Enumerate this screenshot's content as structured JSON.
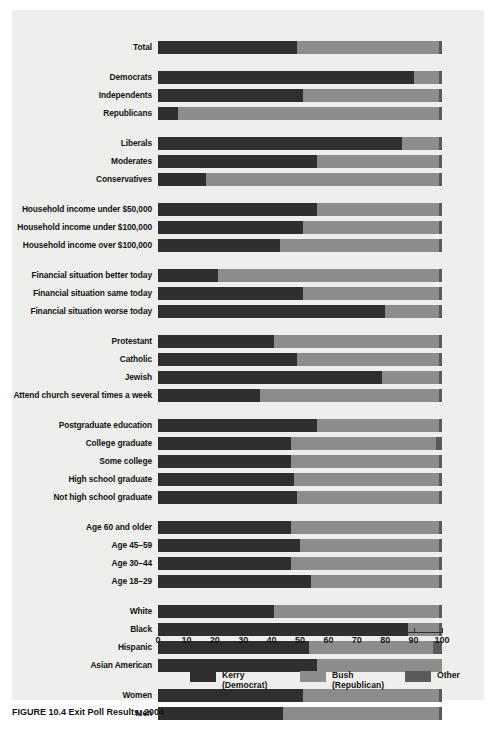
{
  "figure": {
    "caption": "FIGURE 10.4   Exit Poll Results, 2004"
  },
  "chart_data": {
    "type": "bar",
    "orientation": "horizontal",
    "stacked": true,
    "title": "",
    "xlabel": "",
    "ylabel": "",
    "xlim": [
      0,
      100
    ],
    "xticks": [
      0,
      10,
      20,
      30,
      40,
      50,
      60,
      70,
      80,
      90,
      100
    ],
    "grid": false,
    "legend_position": "bottom",
    "series": [
      {
        "name": "Kerry",
        "sub": "(Democrat)",
        "color": "#2f2f2f"
      },
      {
        "name": "Bush",
        "sub": "(Republican)",
        "color": "#8c8c8c"
      },
      {
        "name": "Other",
        "sub": "",
        "color": "#5a5a5a"
      }
    ],
    "groups": [
      {
        "name": "total",
        "rows": [
          {
            "label": "Total",
            "values": [
              49,
              50,
              1
            ]
          }
        ]
      },
      {
        "name": "party",
        "rows": [
          {
            "label": "Democrats",
            "values": [
              90,
              9,
              1
            ]
          },
          {
            "label": "Independents",
            "values": [
              51,
              48,
              1
            ]
          },
          {
            "label": "Republicans",
            "values": [
              7,
              92,
              1
            ]
          }
        ]
      },
      {
        "name": "ideology",
        "rows": [
          {
            "label": "Liberals",
            "values": [
              86,
              13,
              1
            ]
          },
          {
            "label": "Moderates",
            "values": [
              56,
              43,
              1
            ]
          },
          {
            "label": "Conservatives",
            "values": [
              17,
              82,
              1
            ]
          }
        ]
      },
      {
        "name": "income",
        "rows": [
          {
            "label": "Household income under $50,000",
            "values": [
              56,
              43,
              1
            ]
          },
          {
            "label": "Household income under $100,000",
            "values": [
              51,
              48,
              1
            ]
          },
          {
            "label": "Household income over $100,000",
            "values": [
              43,
              56,
              1
            ]
          }
        ]
      },
      {
        "name": "financial-situation",
        "rows": [
          {
            "label": "Financial situation better today",
            "values": [
              21,
              78,
              1
            ]
          },
          {
            "label": "Financial situation same today",
            "values": [
              51,
              48,
              1
            ]
          },
          {
            "label": "Financial situation worse today",
            "values": [
              80,
              19,
              1
            ]
          }
        ]
      },
      {
        "name": "religion",
        "rows": [
          {
            "label": "Protestant",
            "values": [
              41,
              58,
              1
            ]
          },
          {
            "label": "Catholic",
            "values": [
              49,
              50,
              1
            ]
          },
          {
            "label": "Jewish",
            "values": [
              79,
              20,
              1
            ]
          },
          {
            "label": "Attend church several times a week",
            "values": [
              36,
              63,
              1
            ]
          }
        ]
      },
      {
        "name": "education",
        "rows": [
          {
            "label": "Postgraduate education",
            "values": [
              56,
              43,
              1
            ]
          },
          {
            "label": "College graduate",
            "values": [
              47,
              51,
              2
            ]
          },
          {
            "label": "Some college",
            "values": [
              47,
              52,
              1
            ]
          },
          {
            "label": "High school graduate",
            "values": [
              48,
              51,
              1
            ]
          },
          {
            "label": "Not high school graduate",
            "values": [
              49,
              50,
              1
            ]
          }
        ]
      },
      {
        "name": "age",
        "rows": [
          {
            "label": "Age 60 and older",
            "values": [
              47,
              52,
              1
            ]
          },
          {
            "label": "Age 45–59",
            "values": [
              50,
              49,
              1
            ]
          },
          {
            "label": "Age 30–44",
            "values": [
              47,
              52,
              1
            ]
          },
          {
            "label": "Age 18–29",
            "values": [
              54,
              45,
              1
            ]
          }
        ]
      },
      {
        "name": "race",
        "rows": [
          {
            "label": "White",
            "values": [
              41,
              58,
              1
            ]
          },
          {
            "label": "Black",
            "values": [
              88,
              11,
              1
            ]
          },
          {
            "label": "Hispanic",
            "values": [
              53,
              44,
              3
            ]
          },
          {
            "label": "Asian American",
            "values": [
              56,
              44,
              0
            ]
          }
        ]
      },
      {
        "name": "gender",
        "rows": [
          {
            "label": "Women",
            "values": [
              51,
              48,
              1
            ]
          },
          {
            "label": "Men",
            "values": [
              44,
              55,
              1
            ]
          }
        ]
      }
    ]
  }
}
